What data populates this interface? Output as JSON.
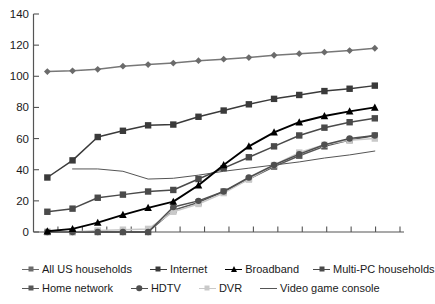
{
  "chart_data": {
    "type": "line",
    "title": "",
    "xlabel": "",
    "ylabel": "",
    "ylim": [
      0,
      140
    ],
    "ytick_step": 20,
    "yticks": [
      0,
      20,
      40,
      60,
      80,
      100,
      120,
      140
    ],
    "grid": false,
    "legend_position": "bottom",
    "x_tick_count": 15,
    "x_tick_labels": [],
    "x": [
      1,
      2,
      3,
      4,
      5,
      6,
      7,
      8,
      9,
      10,
      11,
      12,
      13,
      14
    ],
    "series": [
      {
        "name": "All US households",
        "marker": "diamond",
        "color": "#6b6b6b",
        "line_color": "#777777",
        "values": [
          103,
          103.5,
          104.5,
          106.5,
          107.5,
          108.5,
          110,
          111,
          112,
          113.5,
          114.5,
          115.5,
          116.5,
          118
        ]
      },
      {
        "name": "Internet",
        "marker": "square",
        "color": "#3a3a3a",
        "line_color": "#3a3a3a",
        "values": [
          35,
          46,
          61,
          65,
          68.5,
          69,
          74,
          78,
          82,
          85.5,
          88,
          90.5,
          92,
          94
        ]
      },
      {
        "name": "Broadband",
        "marker": "triangle",
        "color": "#000000",
        "line_color": "#000000",
        "values": [
          0.5,
          2,
          6,
          11,
          15.5,
          19.5,
          30,
          43,
          55,
          64,
          70.5,
          74.5,
          77.5,
          80
        ]
      },
      {
        "name": "Multi-PC households",
        "marker": "square",
        "color": "#4a4a4a",
        "line_color": "#4a4a4a",
        "values": [
          13,
          15,
          22,
          24,
          26,
          27,
          34,
          41,
          48,
          55,
          62,
          67,
          70.5,
          73
        ]
      },
      {
        "name": "Home network",
        "marker": "square",
        "color": "#585858",
        "line_color": "#585858",
        "values": [
          0,
          0,
          0,
          0,
          0,
          14,
          19,
          26,
          34,
          42,
          49,
          55,
          59,
          62
        ]
      },
      {
        "name": "HDTV",
        "marker": "circle",
        "color": "#4f4f4f",
        "line_color": "#4f4f4f",
        "values": [
          0,
          0,
          0,
          0,
          0,
          16,
          20,
          26,
          35,
          43,
          50,
          56,
          60,
          62
        ]
      },
      {
        "name": "DVR",
        "marker": "square",
        "color": "#c9c9c9",
        "line_color": "#c9c9c9",
        "values": [
          0,
          0,
          1,
          1.5,
          2,
          13,
          18,
          25,
          34,
          43,
          51,
          56,
          59,
          60
        ]
      },
      {
        "name": "Video game console",
        "marker": "none",
        "color": "#555555",
        "line_color": "#555555",
        "values": [
          null,
          40.5,
          40.5,
          39,
          34,
          34.5,
          36.5,
          39,
          41,
          43,
          45,
          47.5,
          49.5,
          52
        ]
      }
    ]
  },
  "legend": {
    "rows": [
      [
        {
          "label": "All US households",
          "marker": "diamond",
          "color": "#6b6b6b"
        },
        {
          "label": "Internet",
          "marker": "square",
          "color": "#3a3a3a"
        },
        {
          "label": "Broadband",
          "marker": "triangle",
          "color": "#000000"
        },
        {
          "label": "Multi-PC households",
          "marker": "square",
          "color": "#4a4a4a"
        }
      ],
      [
        {
          "label": "Home network",
          "marker": "square",
          "color": "#585858"
        },
        {
          "label": "HDTV",
          "marker": "circle",
          "color": "#4f4f4f"
        },
        {
          "label": "DVR",
          "marker": "square",
          "color": "#c9c9c9"
        },
        {
          "label": "Video game console",
          "marker": "none",
          "color": "#555555"
        }
      ]
    ]
  },
  "axis": {
    "y_labels": [
      "140",
      "120",
      "100",
      "80",
      "60",
      "40",
      "20",
      "0"
    ]
  }
}
